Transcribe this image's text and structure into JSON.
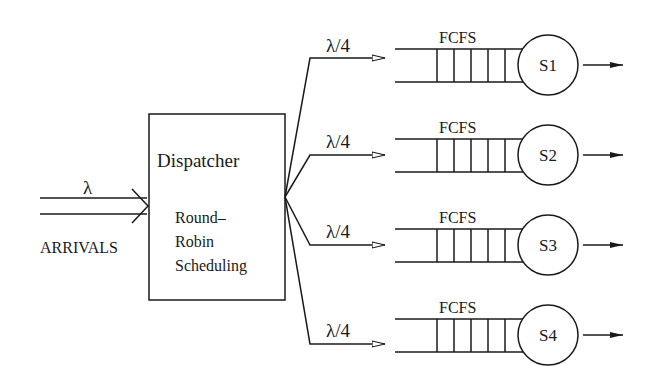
{
  "arrivals": {
    "rate_symbol": "λ",
    "label": "ARRIVALS"
  },
  "dispatcher": {
    "title": "Dispatcher",
    "policy_lines": [
      "Round–",
      "Robin",
      "Scheduling"
    ]
  },
  "branches": [
    {
      "rate": "λ/4",
      "queue_label": "FCFS",
      "server": "S1"
    },
    {
      "rate": "λ/4",
      "queue_label": "FCFS",
      "server": "S2"
    },
    {
      "rate": "λ/4",
      "queue_label": "FCFS",
      "server": "S3"
    },
    {
      "rate": "λ/4",
      "queue_label": "FCFS",
      "server": "S4"
    }
  ],
  "colors": {
    "stroke": "#1a1a1a",
    "background": "#ffffff"
  }
}
